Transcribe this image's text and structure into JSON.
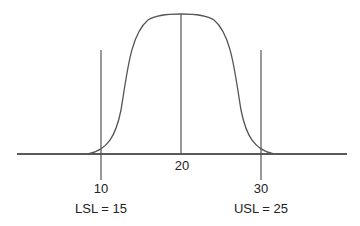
{
  "diagram": {
    "title": "",
    "type": "normal distribution with specification limits",
    "axis_ticks": [
      {
        "label": "10",
        "x": 101
      },
      {
        "label": "20",
        "x": 181
      },
      {
        "label": "30",
        "x": 261
      }
    ],
    "limits": [
      {
        "label": "LSL = 15",
        "x": 101
      },
      {
        "label": "USL = 25",
        "x": 261
      }
    ],
    "colors": {
      "line": "#555555",
      "axis": "#222222",
      "text": "#222222"
    }
  }
}
